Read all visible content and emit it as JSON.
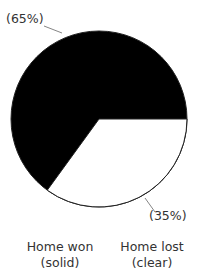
{
  "chart_data": {
    "type": "pie",
    "title": "",
    "categories": [
      "Home won",
      "Home lost"
    ],
    "values": [
      65,
      35
    ],
    "value_labels": [
      "(65%)",
      "(35%)"
    ],
    "fills": [
      "#000000",
      "#ffffff"
    ],
    "fill_descriptions": [
      "solid",
      "clear"
    ],
    "start_angle_deg": 0,
    "direction": "clockwise-from-3-oclock for Home lost",
    "legend": [
      {
        "line1": "Home won",
        "line2": "(solid)"
      },
      {
        "line1": "Home lost",
        "line2": "(clear)"
      }
    ],
    "legend_position": "bottom"
  },
  "geometry": {
    "cx": 99,
    "cy": 119,
    "r": 88
  }
}
